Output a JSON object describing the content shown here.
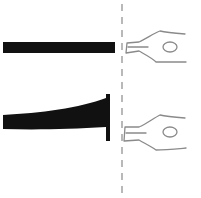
{
  "figure": {
    "colors": {
      "ink": "#111111",
      "nib_outline": "#8a8a8a",
      "divider": "#8a8a8a",
      "background": "#ffffff"
    },
    "panels": [
      {
        "id": "top",
        "stroke_type": "uniform"
      },
      {
        "id": "bottom",
        "stroke_type": "flared"
      }
    ]
  }
}
